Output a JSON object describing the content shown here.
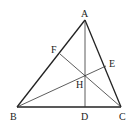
{
  "diagram": {
    "type": "geometry-triangle-orthocenter",
    "points": {
      "A": {
        "x": 85,
        "y": 20,
        "label": "A",
        "lx": 81,
        "ly": 17
      },
      "B": {
        "x": 17,
        "y": 107,
        "label": "B",
        "lx": 10,
        "ly": 120
      },
      "C": {
        "x": 121,
        "y": 107,
        "label": "C",
        "lx": 119,
        "ly": 120
      },
      "D": {
        "x": 85,
        "y": 107,
        "label": "D",
        "lx": 81,
        "ly": 120
      },
      "E": {
        "x": 106,
        "y": 66,
        "label": "E",
        "lx": 109,
        "ly": 67
      },
      "F": {
        "x": 60,
        "y": 54,
        "label": "F",
        "lx": 51,
        "ly": 53
      },
      "H": {
        "x": 85,
        "y": 76,
        "label": "H",
        "lx": 76,
        "ly": 88
      }
    },
    "segments": [
      {
        "from": "A",
        "to": "B",
        "kind": "edge"
      },
      {
        "from": "B",
        "to": "C",
        "kind": "edge"
      },
      {
        "from": "C",
        "to": "A",
        "kind": "edge"
      },
      {
        "from": "A",
        "to": "D",
        "kind": "altitude"
      },
      {
        "from": "B",
        "to": "E",
        "kind": "altitude"
      },
      {
        "from": "C",
        "to": "F",
        "kind": "altitude"
      }
    ]
  }
}
